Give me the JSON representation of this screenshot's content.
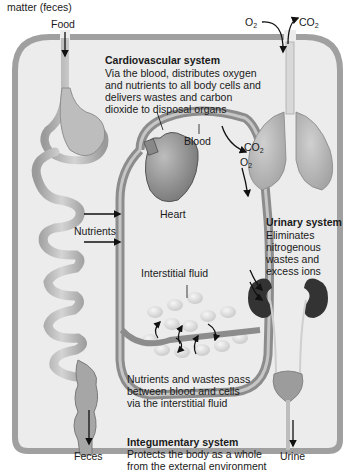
{
  "labels": {
    "top_cut": "matter (feces)",
    "food": "Food",
    "o2_in": "O",
    "co2_out": "CO",
    "blood": "Blood",
    "co2_lung": "CO",
    "o2_lung": "O",
    "heart": "Heart",
    "nutrients": "Nutrients",
    "interstitial_fluid": "Interstitial fluid",
    "feces": "Feces",
    "urine": "Urine",
    "subscript_2": "2"
  },
  "systems": {
    "cardiovascular": {
      "title": "Cardiovascular system",
      "lines": [
        "Via the blood, distributes oxygen",
        "and nutrients to all body cells and",
        "delivers wastes and carbon",
        "dioxide to disposal organs"
      ]
    },
    "urinary": {
      "title": "Urinary system",
      "lines": [
        "Eliminates",
        "nitrogenous",
        "wastes and",
        "excess ions"
      ]
    },
    "integumentary": {
      "title": "Integumentary system",
      "lines": [
        "Protects the body as a whole",
        "from the external environment"
      ]
    }
  },
  "exchange_note": {
    "lines": [
      "Nutrients and wastes pass",
      "between blood and cells",
      "via the interstitial fluid"
    ]
  },
  "colors": {
    "body_fill": "#e9e9e9",
    "body_border": "#9a9a9a",
    "vessel": "#8f8f8f",
    "organ_gray": "#a8a8a8",
    "kidney": "#3a3a3a",
    "arrow": "#111111"
  }
}
